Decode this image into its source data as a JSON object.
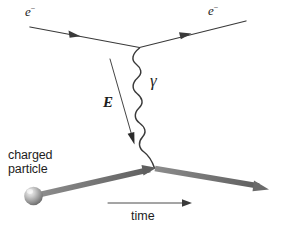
{
  "figure": {
    "kind": "feynman-diagram",
    "title_text": "",
    "background_color": "#ffffff",
    "ink_color": "#3a3a3a",
    "particle_line_color": "#6e6e6e",
    "sphere_color": "#9b9b9b",
    "width_px": 282,
    "height_px": 235
  },
  "labels": {
    "electron_incoming": "e",
    "electron_incoming_charge": "−",
    "electron_outgoing": "e",
    "electron_outgoing_charge": "−",
    "photon": "γ",
    "electric_field": "E",
    "charged_particle_line1": "charged",
    "charged_particle_line2": "particle",
    "time_axis": "time"
  },
  "elements": {
    "electron_in_line": {
      "name": "incoming electron worldline",
      "from": [
        30,
        27
      ],
      "to": [
        139,
        47
      ],
      "arrow_direction": "right",
      "arrow_at": [
        73,
        35
      ]
    },
    "electron_out_line": {
      "name": "outgoing electron worldline",
      "from": [
        139,
        47
      ],
      "to": [
        245,
        21
      ],
      "arrow_direction": "right",
      "arrow_at": [
        183,
        36
      ]
    },
    "photon_wavy_line": {
      "name": "virtual photon",
      "from": [
        139,
        47
      ],
      "to": [
        155,
        168
      ],
      "oscillations": 7,
      "amplitude_px": 9
    },
    "efield_arrow": {
      "name": "electric field vector arrow",
      "from": [
        110,
        60
      ],
      "to": [
        134,
        140
      ],
      "arrow_direction": "down-right"
    },
    "charged_particle_in": {
      "name": "incoming charged particle worldline",
      "from": [
        40,
        194
      ],
      "to": [
        155,
        168
      ],
      "arrow_direction": "up-right",
      "thick": true
    },
    "charged_particle_out": {
      "name": "outgoing charged particle worldline",
      "from": [
        155,
        168
      ],
      "to": [
        266,
        189
      ],
      "arrow_direction": "down-right",
      "thick": true
    },
    "particle_sphere": {
      "name": "charged particle sphere",
      "center": [
        33,
        196
      ],
      "radius_px": 9
    },
    "time_arrow": {
      "name": "time axis arrow",
      "from": [
        108,
        203
      ],
      "to": [
        190,
        203
      ],
      "arrow_direction": "right"
    }
  }
}
